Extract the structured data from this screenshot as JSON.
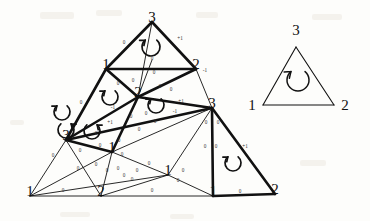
{
  "figure": {
    "type": "simplicial-complex-diagram",
    "background_color": "#fdfdfb",
    "ink_color": "#111111"
  },
  "main_complex": {
    "vertices": [
      {
        "id": "v_apex",
        "label": "3",
        "x": 152,
        "y": 22,
        "size": "large"
      },
      {
        "id": "v_l1",
        "label": "1",
        "x": 106,
        "y": 69,
        "size": "large"
      },
      {
        "id": "v_r2",
        "label": "2",
        "x": 196,
        "y": 69,
        "size": "large"
      },
      {
        "id": "v_c2",
        "label": "2",
        "x": 138,
        "y": 97,
        "size": "large"
      },
      {
        "id": "v_l3",
        "label": "3",
        "x": 66,
        "y": 140,
        "size": "large"
      },
      {
        "id": "v_r3",
        "label": "3",
        "x": 212,
        "y": 108,
        "size": "large"
      },
      {
        "id": "v_m1",
        "label": "1",
        "x": 112,
        "y": 152,
        "size": "large"
      },
      {
        "id": "v_b1",
        "label": "1",
        "x": 30,
        "y": 196,
        "size": "large"
      },
      {
        "id": "v_b2",
        "label": "2",
        "x": 101,
        "y": 196,
        "size": "large"
      },
      {
        "id": "v_bc1",
        "label": "1",
        "x": 168,
        "y": 175,
        "size": "large"
      },
      {
        "id": "v_b1b",
        "label": "1",
        "x": 213,
        "y": 196,
        "size": "large"
      },
      {
        "id": "v_b2r",
        "label": "2",
        "x": 275,
        "y": 194,
        "size": "large"
      }
    ],
    "edge_labels": [
      {
        "value": "0",
        "x": 124,
        "y": 44
      },
      {
        "value": "+1",
        "x": 180,
        "y": 40
      },
      {
        "value": "0",
        "x": 152,
        "y": 60
      },
      {
        "value": "0",
        "x": 154,
        "y": 74
      },
      {
        "value": "0",
        "x": 118,
        "y": 85
      },
      {
        "value": "0",
        "x": 133,
        "y": 82
      },
      {
        "value": "0",
        "x": 160,
        "y": 88
      },
      {
        "value": "0",
        "x": 171,
        "y": 91
      },
      {
        "value": "-1",
        "x": 205,
        "y": 72
      },
      {
        "value": "+1",
        "x": 181,
        "y": 103
      },
      {
        "value": "-1",
        "x": 175,
        "y": 113
      },
      {
        "value": "0",
        "x": 81,
        "y": 104
      },
      {
        "value": "-1",
        "x": 113,
        "y": 109
      },
      {
        "value": "+1",
        "x": 110,
        "y": 124
      },
      {
        "value": "0",
        "x": 131,
        "y": 118
      },
      {
        "value": "0",
        "x": 146,
        "y": 115
      },
      {
        "value": "0",
        "x": 155,
        "y": 123
      },
      {
        "value": "0",
        "x": 139,
        "y": 131
      },
      {
        "value": "0",
        "x": 96,
        "y": 135
      },
      {
        "value": "0",
        "x": 100,
        "y": 147
      },
      {
        "value": "0",
        "x": 119,
        "y": 142
      },
      {
        "value": "0",
        "x": 53,
        "y": 157
      },
      {
        "value": "0",
        "x": 80,
        "y": 152
      },
      {
        "value": "0",
        "x": 78,
        "y": 170
      },
      {
        "value": "0",
        "x": 96,
        "y": 166
      },
      {
        "value": "0",
        "x": 107,
        "y": 172
      },
      {
        "value": "0",
        "x": 118,
        "y": 170
      },
      {
        "value": "0",
        "x": 124,
        "y": 177
      },
      {
        "value": "0",
        "x": 137,
        "y": 172
      },
      {
        "value": "0",
        "x": 132,
        "y": 181
      },
      {
        "value": "0",
        "x": 183,
        "y": 172
      },
      {
        "value": "0",
        "x": 178,
        "y": 182
      },
      {
        "value": "0",
        "x": 205,
        "y": 148
      },
      {
        "value": "0",
        "x": 216,
        "y": 148
      },
      {
        "value": "+1",
        "x": 245,
        "y": 148
      },
      {
        "value": "0",
        "x": 206,
        "y": 124
      },
      {
        "value": "0",
        "x": 218,
        "y": 124
      },
      {
        "value": "0",
        "x": 63,
        "y": 192
      },
      {
        "value": "0",
        "x": 152,
        "y": 192
      },
      {
        "value": "0",
        "x": 240,
        "y": 193
      },
      {
        "value": "0",
        "x": 122,
        "y": 156
      },
      {
        "value": "0",
        "x": 149,
        "y": 165
      }
    ],
    "orientation_arrows": [
      {
        "id": "arrow-top",
        "x": 151,
        "y": 47,
        "r": 9,
        "direction": "ccw"
      },
      {
        "id": "arrow-mid-left",
        "x": 110,
        "y": 97,
        "r": 8,
        "direction": "ccw"
      },
      {
        "id": "arrow-mid-right",
        "x": 156,
        "y": 105,
        "r": 8,
        "direction": "ccw"
      },
      {
        "id": "arrow-far-left",
        "x": 62,
        "y": 112,
        "r": 8,
        "direction": "ccw"
      },
      {
        "id": "arrow-left-low",
        "x": 66,
        "y": 130,
        "r": 8,
        "direction": "cw"
      },
      {
        "id": "arrow-low-mid",
        "x": 92,
        "y": 131,
        "r": 8,
        "direction": "cw"
      },
      {
        "id": "arrow-bottom-rt",
        "x": 233,
        "y": 163,
        "r": 8,
        "direction": "ccw"
      }
    ],
    "thick_edges": [
      [
        152,
        22,
        106,
        69
      ],
      [
        152,
        22,
        196,
        69
      ],
      [
        106,
        69,
        196,
        69
      ],
      [
        106,
        69,
        138,
        97
      ],
      [
        138,
        97,
        196,
        69
      ],
      [
        106,
        69,
        66,
        140
      ],
      [
        66,
        140,
        138,
        97
      ],
      [
        138,
        97,
        212,
        108
      ],
      [
        66,
        140,
        212,
        108
      ],
      [
        66,
        140,
        112,
        152
      ],
      [
        112,
        152,
        138,
        97
      ],
      [
        212,
        108,
        213,
        196
      ],
      [
        213,
        196,
        275,
        194
      ],
      [
        212,
        108,
        275,
        194
      ]
    ],
    "thin_edges": [
      [
        196,
        69,
        212,
        108
      ],
      [
        138,
        97,
        152,
        60
      ],
      [
        66,
        140,
        30,
        196
      ],
      [
        30,
        196,
        101,
        196
      ],
      [
        30,
        196,
        112,
        152
      ],
      [
        101,
        196,
        112,
        152
      ],
      [
        101,
        196,
        168,
        175
      ],
      [
        112,
        152,
        168,
        175
      ],
      [
        168,
        175,
        213,
        196
      ],
      [
        101,
        196,
        213,
        196
      ],
      [
        168,
        175,
        212,
        108
      ],
      [
        112,
        152,
        212,
        108
      ],
      [
        30,
        196,
        168,
        175
      ],
      [
        66,
        140,
        101,
        196
      ],
      [
        152,
        22,
        138,
        97
      ],
      [
        196,
        69,
        138,
        97
      ]
    ]
  },
  "reference_triangle": {
    "vertices": [
      {
        "label": "3",
        "x": 296,
        "y": 35
      },
      {
        "label": "1",
        "x": 252,
        "y": 110
      },
      {
        "label": "2",
        "x": 345,
        "y": 110
      }
    ],
    "arrow": {
      "x": 298,
      "y": 80,
      "r": 11,
      "direction": "ccw"
    }
  }
}
